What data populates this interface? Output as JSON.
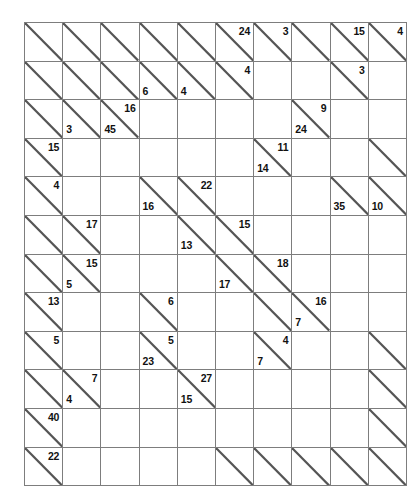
{
  "puzzle": {
    "type": "kakuro",
    "rows": 12,
    "cols": 10,
    "colors": {
      "clue_cell_fill": "#c0c0c0",
      "entry_cell_fill": "#ffffff",
      "grid_line": "#7d7d7d",
      "diagonal_line": "#555555",
      "clue_text": "#111111",
      "page_background": "#ffffff"
    },
    "legend": {
      "down_clue_position": "upper-right",
      "across_clue_position": "lower-left"
    },
    "cells": [
      [
        {
          "k": "clue",
          "down": "",
          "across": ""
        },
        {
          "k": "clue",
          "down": "",
          "across": ""
        },
        {
          "k": "clue",
          "down": "",
          "across": ""
        },
        {
          "k": "clue",
          "down": "",
          "across": ""
        },
        {
          "k": "clue",
          "down": "",
          "across": ""
        },
        {
          "k": "clue",
          "down": "24",
          "across": ""
        },
        {
          "k": "clue",
          "down": "3",
          "across": ""
        },
        {
          "k": "clue",
          "down": "",
          "across": ""
        },
        {
          "k": "clue",
          "down": "15",
          "across": ""
        },
        {
          "k": "clue",
          "down": "4",
          "across": ""
        }
      ],
      [
        {
          "k": "clue",
          "down": "",
          "across": ""
        },
        {
          "k": "clue",
          "down": "",
          "across": ""
        },
        {
          "k": "clue",
          "down": "",
          "across": ""
        },
        {
          "k": "clue",
          "down": "",
          "across": "6"
        },
        {
          "k": "clue",
          "down": "",
          "across": "4"
        },
        {
          "k": "clue",
          "down": "4",
          "across": ""
        },
        {
          "k": "entry"
        },
        {
          "k": "entry"
        },
        {
          "k": "clue",
          "down": "3",
          "across": ""
        },
        {
          "k": "entry"
        }
      ],
      [
        {
          "k": "clue",
          "down": "",
          "across": ""
        },
        {
          "k": "clue",
          "down": "",
          "across": "3"
        },
        {
          "k": "clue",
          "down": "16",
          "across": "45"
        },
        {
          "k": "entry"
        },
        {
          "k": "entry"
        },
        {
          "k": "entry"
        },
        {
          "k": "entry"
        },
        {
          "k": "clue",
          "down": "9",
          "across": "24"
        },
        {
          "k": "entry"
        },
        {
          "k": "entry"
        }
      ],
      [
        {
          "k": "clue",
          "down": "15",
          "across": ""
        },
        {
          "k": "entry"
        },
        {
          "k": "entry"
        },
        {
          "k": "entry"
        },
        {
          "k": "entry"
        },
        {
          "k": "entry"
        },
        {
          "k": "clue",
          "down": "11",
          "across": "14"
        },
        {
          "k": "entry"
        },
        {
          "k": "entry"
        },
        {
          "k": "clue",
          "down": "",
          "across": ""
        }
      ],
      [
        {
          "k": "clue",
          "down": "4",
          "across": ""
        },
        {
          "k": "entry"
        },
        {
          "k": "entry"
        },
        {
          "k": "clue",
          "down": "",
          "across": "16"
        },
        {
          "k": "clue",
          "down": "22",
          "across": ""
        },
        {
          "k": "entry"
        },
        {
          "k": "entry"
        },
        {
          "k": "entry"
        },
        {
          "k": "clue",
          "down": "",
          "across": "35"
        },
        {
          "k": "clue",
          "down": "",
          "across": "10"
        }
      ],
      [
        {
          "k": "clue",
          "down": "",
          "across": ""
        },
        {
          "k": "clue",
          "down": "17",
          "across": ""
        },
        {
          "k": "entry"
        },
        {
          "k": "entry"
        },
        {
          "k": "clue",
          "down": "",
          "across": "13"
        },
        {
          "k": "clue",
          "down": "15",
          "across": ""
        },
        {
          "k": "entry"
        },
        {
          "k": "entry"
        },
        {
          "k": "entry"
        },
        {
          "k": "entry"
        }
      ],
      [
        {
          "k": "clue",
          "down": "",
          "across": ""
        },
        {
          "k": "clue",
          "down": "15",
          "across": "5"
        },
        {
          "k": "entry"
        },
        {
          "k": "entry"
        },
        {
          "k": "entry"
        },
        {
          "k": "clue",
          "down": "",
          "across": "17"
        },
        {
          "k": "clue",
          "down": "18",
          "across": ""
        },
        {
          "k": "entry"
        },
        {
          "k": "entry"
        },
        {
          "k": "entry"
        }
      ],
      [
        {
          "k": "clue",
          "down": "13",
          "across": ""
        },
        {
          "k": "entry"
        },
        {
          "k": "entry"
        },
        {
          "k": "clue",
          "down": "6",
          "across": ""
        },
        {
          "k": "entry"
        },
        {
          "k": "entry"
        },
        {
          "k": "clue",
          "down": "",
          "across": ""
        },
        {
          "k": "clue",
          "down": "16",
          "across": "7"
        },
        {
          "k": "entry"
        },
        {
          "k": "entry"
        }
      ],
      [
        {
          "k": "clue",
          "down": "5",
          "across": ""
        },
        {
          "k": "entry"
        },
        {
          "k": "entry"
        },
        {
          "k": "clue",
          "down": "5",
          "across": "23"
        },
        {
          "k": "entry"
        },
        {
          "k": "entry"
        },
        {
          "k": "clue",
          "down": "4",
          "across": "7"
        },
        {
          "k": "entry"
        },
        {
          "k": "entry"
        },
        {
          "k": "clue",
          "down": "",
          "across": ""
        }
      ],
      [
        {
          "k": "clue",
          "down": "",
          "across": ""
        },
        {
          "k": "clue",
          "down": "7",
          "across": "4"
        },
        {
          "k": "entry"
        },
        {
          "k": "entry"
        },
        {
          "k": "clue",
          "down": "27",
          "across": "15"
        },
        {
          "k": "entry"
        },
        {
          "k": "entry"
        },
        {
          "k": "entry"
        },
        {
          "k": "entry"
        },
        {
          "k": "clue",
          "down": "",
          "across": ""
        }
      ],
      [
        {
          "k": "clue",
          "down": "40",
          "across": ""
        },
        {
          "k": "entry"
        },
        {
          "k": "entry"
        },
        {
          "k": "entry"
        },
        {
          "k": "entry"
        },
        {
          "k": "entry"
        },
        {
          "k": "entry"
        },
        {
          "k": "entry"
        },
        {
          "k": "entry"
        },
        {
          "k": "clue",
          "down": "",
          "across": ""
        }
      ],
      [
        {
          "k": "clue",
          "down": "22",
          "across": ""
        },
        {
          "k": "entry"
        },
        {
          "k": "entry"
        },
        {
          "k": "entry"
        },
        {
          "k": "entry"
        },
        {
          "k": "clue",
          "down": "",
          "across": ""
        },
        {
          "k": "clue",
          "down": "",
          "across": ""
        },
        {
          "k": "clue",
          "down": "",
          "across": ""
        },
        {
          "k": "clue",
          "down": "",
          "across": ""
        },
        {
          "k": "clue",
          "down": "",
          "across": ""
        }
      ]
    ]
  }
}
